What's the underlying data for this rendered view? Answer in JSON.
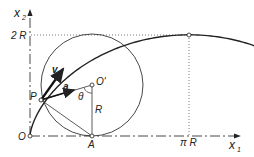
{
  "diagram": {
    "axes": {
      "x_label": "x",
      "x_sub": "1",
      "y_label": "x",
      "y_sub": "2"
    },
    "labels": {
      "two_r": "2 R",
      "pi_r": "π R",
      "origin": "O",
      "point_p": "P",
      "point_a": "A",
      "center": "O'",
      "radius": "R",
      "angle": "θ",
      "velocity": "v",
      "acceleration": "a"
    },
    "colors": {
      "stroke": "#222222",
      "background": "#ffffff"
    }
  }
}
